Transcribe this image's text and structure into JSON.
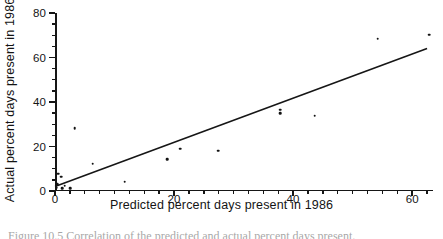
{
  "figure": {
    "caption": "Figure 10.5  Correlation of the predicted and actual percent days present."
  },
  "chart_data": {
    "type": "scatter",
    "title": "",
    "xlabel": "Predicted percent days present in 1986",
    "ylabel": "Actual percent days present in 1986",
    "xlim": [
      0,
      63.5
    ],
    "ylim": [
      0,
      80
    ],
    "grid": false,
    "legend": "none",
    "x_major_ticks": [
      0,
      20,
      40,
      60
    ],
    "x_major_tick_labels": [
      "0",
      "20",
      "40",
      "60"
    ],
    "x_minor_tick_step": 2.5,
    "y_major_ticks": [
      0,
      20,
      40,
      60,
      80
    ],
    "y_major_tick_labels": [
      "0",
      "20",
      "40",
      "60",
      "80"
    ],
    "y_minor_tick_step": 5,
    "points": [
      {
        "x": 0.3,
        "y": 1.5
      },
      {
        "x": 0.4,
        "y": 3.0
      },
      {
        "x": 0.5,
        "y": 7.8
      },
      {
        "x": 1.0,
        "y": 6.5
      },
      {
        "x": 1.2,
        "y": 1.2
      },
      {
        "x": 1.6,
        "y": 2.4
      },
      {
        "x": 2.6,
        "y": 1.3
      },
      {
        "x": 3.3,
        "y": 28.2
      },
      {
        "x": 6.3,
        "y": 12.2
      },
      {
        "x": 11.7,
        "y": 4.2
      },
      {
        "x": 18.8,
        "y": 14.2
      },
      {
        "x": 21.0,
        "y": 19.0
      },
      {
        "x": 27.4,
        "y": 18.2
      },
      {
        "x": 37.8,
        "y": 36.6
      },
      {
        "x": 37.8,
        "y": 35.0
      },
      {
        "x": 43.6,
        "y": 33.8
      },
      {
        "x": 54.2,
        "y": 68.4
      },
      {
        "x": 62.9,
        "y": 70.3
      }
    ],
    "fit_line": {
      "label": "regression line",
      "x_start": 0.0,
      "y_start": 2.0,
      "x_end": 62.5,
      "y_end": 64.0
    },
    "series": [
      {
        "name": "observations",
        "marker": "filled-circle",
        "color": "#121212"
      }
    ]
  }
}
